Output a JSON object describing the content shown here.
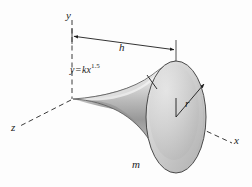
{
  "figure": {
    "background_color": "#fdfdfd",
    "ink_color": "#1c1c1c",
    "axes": {
      "y_label": "y",
      "z_label": "z",
      "x_label": "x",
      "origin": {
        "x": 72,
        "y": 98
      },
      "y_axis_end": {
        "x": 72,
        "y": 20
      },
      "z_axis_end": {
        "x": 20,
        "y": 126
      },
      "x_axis_end": {
        "x": 232,
        "y": 143
      },
      "style": "dashed"
    },
    "dimension": {
      "label": "h",
      "start": {
        "x": 72,
        "y": 36
      },
      "end": {
        "x": 176,
        "y": 50
      },
      "arrowheads": "both"
    },
    "curve_annotation": {
      "text_y": "y",
      "text_equals": "=",
      "text_kx": "kx",
      "exponent": "1.5",
      "full_text": "y = kx1.5",
      "leader_from": {
        "x": 148,
        "y": 76
      },
      "leader_to": {
        "x": 158,
        "y": 88
      }
    },
    "radius": {
      "label": "r",
      "from": {
        "x": 176,
        "y": 117
      },
      "to": {
        "x": 206,
        "y": 82
      },
      "arrowhead": "end"
    },
    "mass": {
      "label": "m"
    },
    "solid": {
      "description": "flared horn / trumpet solid of revolution about the x-axis",
      "apex": {
        "x": 73,
        "y": 99
      },
      "end_face_center": {
        "x": 176,
        "y": 117
      },
      "end_face_rx": 30,
      "end_face_ry": 56,
      "fill_light": "#f2f2f2",
      "fill_mid": "#c9c9c9",
      "fill_dark": "#9a9a9a",
      "outline": "#4a4a4a"
    }
  }
}
